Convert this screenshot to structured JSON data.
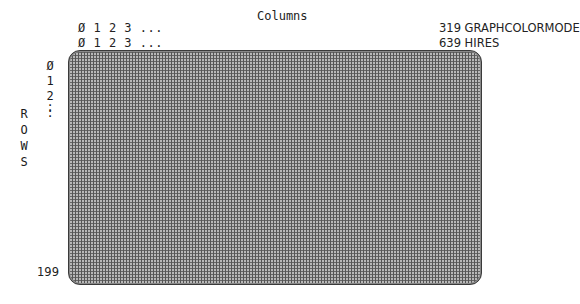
{
  "diagram": {
    "columns_title": "Columns",
    "column_ruler_graph": "Ø 1 2 3 ...",
    "column_ruler_hires": "Ø 1 2 3 ...",
    "modes": [
      {
        "max_column": "319",
        "name": "GRAPHCOLORMODE",
        "label": "319 GRAPHCOLORMODE"
      },
      {
        "max_column": "639",
        "name": "HIRES",
        "label": "639 HIRES"
      }
    ],
    "rows_title_letters": [
      "R",
      "O",
      "W",
      "S"
    ],
    "row_ruler": [
      "Ø",
      "1",
      "2",
      ":",
      ":"
    ],
    "last_row": "199",
    "grid_fill_color": "#b8b8b8",
    "grid_line_color": "#555555",
    "border_color": "#3a3a3a"
  }
}
